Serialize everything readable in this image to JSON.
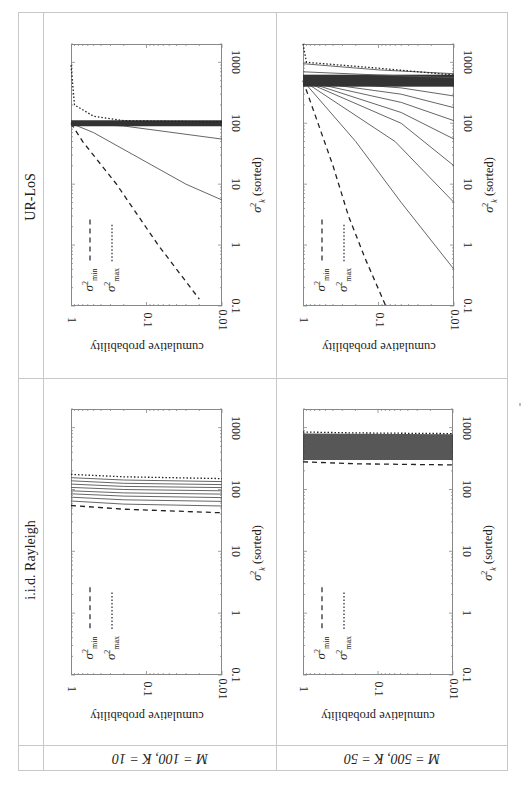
{
  "table": {
    "column_headers": [
      "UR-LoS",
      "i.i.d. Rayleigh"
    ],
    "row_headers": [
      "M = 100, K = 10",
      "M = 500, K = 50"
    ]
  },
  "axes": {
    "x_label": "cumulative probability",
    "y_label_symbol": "σ",
    "y_label_sub": "k",
    "y_label_sup": "2",
    "y_label_suffix": " (sorted)",
    "prob_ticks": [
      "1",
      "0.1",
      "0.01"
    ],
    "sigma_ticks": [
      "0.1",
      "1",
      "10",
      "100",
      "1000"
    ]
  },
  "legend": {
    "min": {
      "symbol": "σ",
      "sup": "2",
      "sub": "min",
      "style": "dashed"
    },
    "max": {
      "symbol": "σ",
      "sup": "2",
      "sub": "max",
      "style": "dotted"
    }
  },
  "colors": {
    "grid_line": "#c8c8c8",
    "curve": "#555555",
    "frame": "#888888"
  },
  "chart_data": [
    {
      "type": "line",
      "title": "UR-LoS, M = 100, K = 10",
      "xlabel": "σ_k^2 (sorted)",
      "ylabel": "cumulative probability",
      "xscale": "log",
      "yscale": "log",
      "xlim": [
        0.1,
        2000
      ],
      "ylim": [
        0.01,
        1
      ],
      "series": [
        {
          "name": "σ²_min",
          "style": "dashed",
          "points": [
            [
              100,
              1
            ],
            [
              50,
              0.7
            ],
            [
              10,
              0.25
            ],
            [
              1,
              0.07
            ],
            [
              0.13,
              0.02
            ]
          ]
        },
        {
          "name": "sorted k=2",
          "style": "solid",
          "points": [
            [
              100,
              1
            ],
            [
              70,
              0.5
            ],
            [
              10,
              0.03
            ],
            [
              5.5,
              0.01
            ]
          ]
        },
        {
          "name": "sorted k=3",
          "style": "solid",
          "points": [
            [
              100,
              1
            ],
            [
              90,
              0.2
            ],
            [
              55,
              0.01
            ]
          ]
        },
        {
          "name": "sorted k=4..9",
          "style": "solid-bundle",
          "points": [
            [
              100,
              1
            ],
            [
              100,
              0.01
            ]
          ]
        },
        {
          "name": "σ²_max",
          "style": "dotted",
          "points": [
            [
              900,
              1
            ],
            [
              200,
              0.9
            ],
            [
              130,
              0.5
            ],
            [
              110,
              0.2
            ],
            [
              105,
              0.01
            ]
          ]
        }
      ]
    },
    {
      "type": "line",
      "title": "UR-LoS, M = 500, K = 50",
      "xlabel": "σ_k^2 (sorted)",
      "ylabel": "cumulative probability",
      "xscale": "log",
      "yscale": "log",
      "xlim": [
        0.1,
        2000
      ],
      "ylim": [
        0.01,
        1
      ],
      "series": [
        {
          "name": "σ²_min",
          "style": "dashed",
          "points": [
            [
              500,
              1
            ],
            [
              20,
              0.4
            ],
            [
              3,
              0.25
            ],
            [
              0.6,
              0.15
            ],
            [
              0.1,
              0.08
            ]
          ]
        },
        {
          "name": "sorted k=2",
          "style": "solid",
          "points": [
            [
              500,
              1
            ],
            [
              50,
              0.2
            ],
            [
              5,
              0.05
            ],
            [
              0.4,
              0.01
            ]
          ]
        },
        {
          "name": "sorted k=3",
          "style": "solid",
          "points": [
            [
              500,
              1
            ],
            [
              50,
              0.06
            ],
            [
              5,
              0.01
            ]
          ]
        },
        {
          "name": "sorted k=4",
          "style": "solid",
          "points": [
            [
              500,
              1
            ],
            [
              100,
              0.05
            ],
            [
              20,
              0.01
            ]
          ]
        },
        {
          "name": "sorted k=5",
          "style": "solid",
          "points": [
            [
              500,
              1
            ],
            [
              150,
              0.05
            ],
            [
              55,
              0.01
            ]
          ]
        },
        {
          "name": "sorted k=6",
          "style": "solid",
          "points": [
            [
              500,
              1
            ],
            [
              220,
              0.05
            ],
            [
              110,
              0.01
            ]
          ]
        },
        {
          "name": "sorted k=7",
          "style": "solid",
          "points": [
            [
              500,
              1
            ],
            [
              300,
              0.05
            ],
            [
              180,
              0.01
            ]
          ]
        },
        {
          "name": "sorted k=8",
          "style": "solid",
          "points": [
            [
              500,
              1
            ],
            [
              380,
              0.05
            ],
            [
              280,
              0.01
            ]
          ]
        },
        {
          "name": "sorted bundle",
          "style": "solid-bundle",
          "points": [
            [
              500,
              1
            ],
            [
              500,
              0.01
            ]
          ]
        },
        {
          "name": "sorted k=48",
          "style": "solid",
          "points": [
            [
              700,
              1
            ],
            [
              620,
              0.1
            ],
            [
              560,
              0.01
            ]
          ]
        },
        {
          "name": "sorted k=49",
          "style": "solid",
          "points": [
            [
              950,
              1
            ],
            [
              750,
              0.1
            ],
            [
              650,
              0.01
            ]
          ]
        },
        {
          "name": "σ²_max",
          "style": "dotted",
          "points": [
            [
              2000,
              1
            ],
            [
              1000,
              0.9
            ],
            [
              800,
              0.1
            ],
            [
              620,
              0.01
            ]
          ]
        }
      ]
    },
    {
      "type": "line",
      "title": "i.i.d. Rayleigh, M = 100, K = 10",
      "xlabel": "σ_k^2 (sorted)",
      "ylabel": "cumulative probability",
      "xscale": "log",
      "yscale": "log",
      "xlim": [
        0.1,
        2000
      ],
      "ylim": [
        0.01,
        1
      ],
      "series": [
        {
          "name": "σ²_min",
          "style": "dashed",
          "points": [
            [
              55,
              1
            ],
            [
              48,
              0.2
            ],
            [
              42,
              0.01
            ]
          ]
        },
        {
          "name": "sorted k=2",
          "style": "solid",
          "points": [
            [
              65,
              1
            ],
            [
              58,
              0.2
            ],
            [
              54,
              0.01
            ]
          ]
        },
        {
          "name": "sorted k=3",
          "style": "solid",
          "points": [
            [
              75,
              1
            ],
            [
              68,
              0.2
            ],
            [
              64,
              0.01
            ]
          ]
        },
        {
          "name": "sorted k=4",
          "style": "solid",
          "points": [
            [
              85,
              1
            ],
            [
              78,
              0.2
            ],
            [
              74,
              0.01
            ]
          ]
        },
        {
          "name": "sorted k=5",
          "style": "solid",
          "points": [
            [
              95,
              1
            ],
            [
              88,
              0.2
            ],
            [
              84,
              0.01
            ]
          ]
        },
        {
          "name": "sorted k=6",
          "style": "solid",
          "points": [
            [
              108,
              1
            ],
            [
              100,
              0.2
            ],
            [
              95,
              0.01
            ]
          ]
        },
        {
          "name": "sorted k=7",
          "style": "solid",
          "points": [
            [
              122,
              1
            ],
            [
              112,
              0.2
            ],
            [
              107,
              0.01
            ]
          ]
        },
        {
          "name": "sorted k=8",
          "style": "solid",
          "points": [
            [
              138,
              1
            ],
            [
              126,
              0.2
            ],
            [
              120,
              0.01
            ]
          ]
        },
        {
          "name": "sorted k=9",
          "style": "solid",
          "points": [
            [
              155,
              1
            ],
            [
              142,
              0.2
            ],
            [
              134,
              0.01
            ]
          ]
        },
        {
          "name": "σ²_max",
          "style": "dotted",
          "points": [
            [
              175,
              1
            ],
            [
              160,
              0.2
            ],
            [
              150,
              0.01
            ]
          ]
        }
      ]
    },
    {
      "type": "line",
      "title": "i.i.d. Rayleigh, M = 500, K = 50",
      "xlabel": "σ_k^2 (sorted)",
      "ylabel": "cumulative probability",
      "xscale": "log",
      "yscale": "log",
      "xlim": [
        0.1,
        2000
      ],
      "ylim": [
        0.01,
        1
      ],
      "series": [
        {
          "name": "σ²_min",
          "style": "dashed",
          "points": [
            [
              280,
              1
            ],
            [
              260,
              0.2
            ],
            [
              250,
              0.01
            ]
          ]
        },
        {
          "name": "sorted bundle",
          "style": "solid-bundle",
          "points": [
            [
              300,
              1
            ],
            [
              800,
              1
            ],
            [
              300,
              0.01
            ],
            [
              780,
              0.01
            ]
          ]
        },
        {
          "name": "σ²_max",
          "style": "dotted",
          "points": [
            [
              850,
              1
            ],
            [
              820,
              0.2
            ],
            [
              800,
              0.01
            ]
          ]
        }
      ]
    }
  ]
}
